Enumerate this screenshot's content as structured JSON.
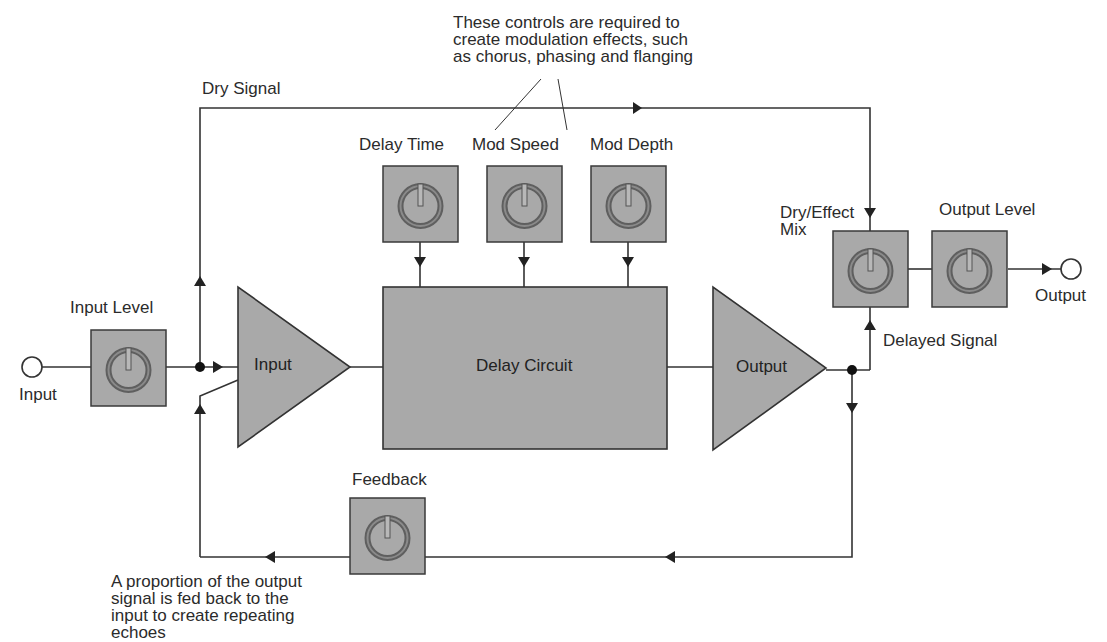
{
  "diagram": {
    "annotation_top": {
      "lines": [
        "These controls are required to",
        "create modulation effects, such",
        "as chorus, phasing and flanging"
      ]
    },
    "annotation_bottom": {
      "lines": [
        "A proportion of the output",
        "signal is fed back to the",
        "input to create repeating",
        "echoes"
      ]
    },
    "signals": {
      "dry": "Dry Signal",
      "delayed": "Delayed Signal"
    },
    "terminals": {
      "input": "Input",
      "output": "Output"
    },
    "blocks": {
      "input_amp": "Input",
      "delay_circuit": "Delay Circuit",
      "output_amp": "Output"
    },
    "knobs": {
      "input_level": "Input Level",
      "delay_time": "Delay Time",
      "mod_speed": "Mod Speed",
      "mod_depth": "Mod Depth",
      "dry_effect_mix_line1": "Dry/Effect",
      "dry_effect_mix_line2": "Mix",
      "output_level": "Output Level",
      "feedback": "Feedback"
    },
    "colors": {
      "block_fill": "#a9a9a9",
      "line": "#333333",
      "knob_ring": "#6e6e6e",
      "background": "#ffffff"
    }
  }
}
